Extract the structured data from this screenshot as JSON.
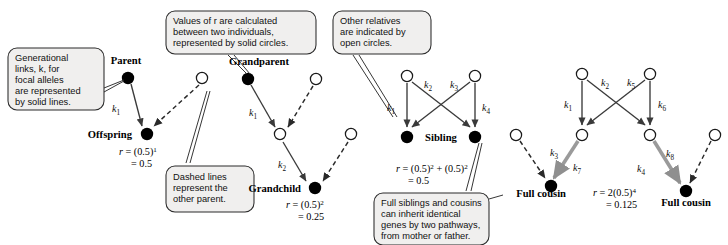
{
  "figure": {
    "background": "#ffffff",
    "node_fill_solid": "#000000",
    "node_fill_open": "#ffffff",
    "callout_fill": "#f0efee",
    "callout_stroke": "#2b2b2b"
  },
  "callouts": [
    {
      "id": "generational-links",
      "lines": [
        "Generational",
        "links, k, for",
        "focal alleles",
        "are represented",
        "by solid lines."
      ]
    },
    {
      "id": "values-of-r",
      "lines": [
        "Values of r are calculated",
        "between two individuals,",
        "represented by solid circles."
      ]
    },
    {
      "id": "other-relatives",
      "lines": [
        "Other relatives",
        "are indicated by",
        "open circles."
      ]
    },
    {
      "id": "dashed-lines",
      "lines": [
        "Dashed lines",
        "represent the",
        "other parent."
      ]
    },
    {
      "id": "full-siblings",
      "lines": [
        "Full siblings and cousins",
        "can inherit identical",
        "genes by two pathways,",
        "from mother or father."
      ]
    }
  ],
  "node_labels": {
    "parent": "Parent",
    "offspring": "Offspring",
    "grandparent": "Grandparent",
    "grandchild": "Grandchild",
    "sibling": "Sibling",
    "full_cousin_left": "Full cousin",
    "full_cousin_right": "Full cousin"
  },
  "edge_labels": {
    "parent_k1": "k",
    "parent_k1_sub": "1",
    "grandparent_k1": "k",
    "grandparent_k1_sub": "1",
    "grandparent_k2": "k",
    "grandparent_k2_sub": "2",
    "sibling_k1": "k",
    "sibling_k1_sub": "1",
    "sibling_k2": "k",
    "sibling_k2_sub": "2",
    "sibling_k3": "k",
    "sibling_k3_sub": "3",
    "sibling_k4": "k",
    "sibling_k4_sub": "4",
    "cousin_k1": "k",
    "cousin_k1_sub": "1",
    "cousin_k2": "k",
    "cousin_k2_sub": "2",
    "cousin_k5": "k",
    "cousin_k5_sub": "5",
    "cousin_k6": "k",
    "cousin_k6_sub": "6",
    "cousin_k3": "k",
    "cousin_k3_sub": "3",
    "cousin_k7": "k",
    "cousin_k7_sub": "7",
    "cousin_k4": "k",
    "cousin_k4_sub": "4",
    "cousin_k8": "k",
    "cousin_k8_sub": "8"
  },
  "formulas": {
    "offspring": {
      "line1_prefix": "r",
      "line1_eq": " = (0.5)",
      "line1_sup": "1",
      "line2": "=  0.5"
    },
    "grandchild": {
      "line1_prefix": "r",
      "line1_eq": " = (0.5)",
      "line1_sup": "2",
      "line2": "=  0.25"
    },
    "sibling": {
      "line1_prefix": "r",
      "line1_eq": " = (0.5)",
      "line1_sup": "2",
      "line1_mid": " + (0.5)",
      "line1_sup2": "2",
      "line2": "=  0.5"
    },
    "cousin": {
      "line1_prefix": "r",
      "line1_eq": " = 2(0.5)",
      "line1_sup": "4",
      "line2": "=   0.125"
    }
  }
}
